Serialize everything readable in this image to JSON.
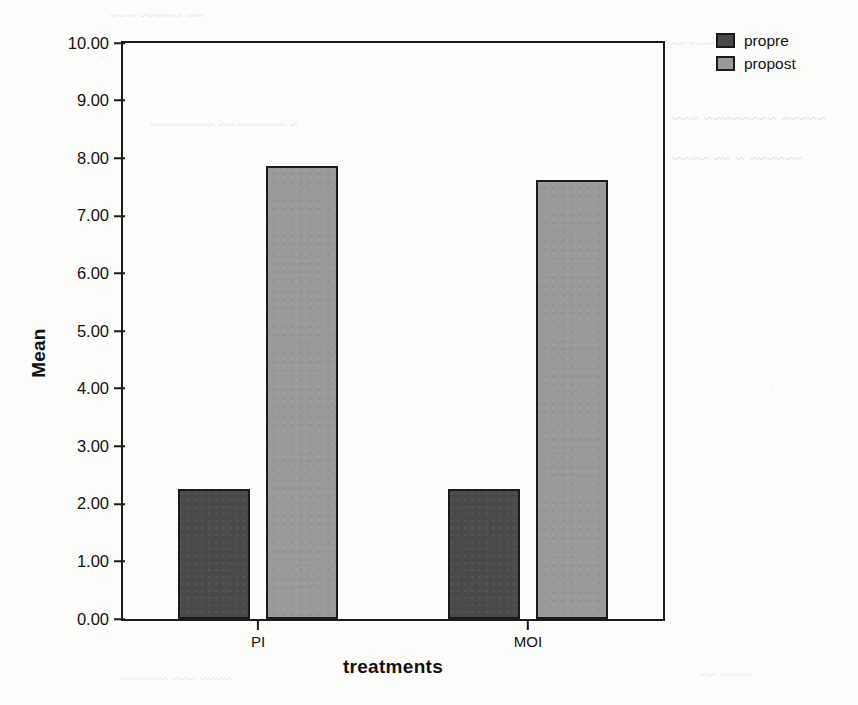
{
  "chart_data": {
    "type": "bar",
    "title": "",
    "xlabel": "treatments",
    "ylabel": "Mean",
    "categories": [
      "PI",
      "MOI"
    ],
    "series": [
      {
        "name": "propre",
        "values": [
          2.26,
          2.26
        ],
        "color": "#4a4a4a"
      },
      {
        "name": "propost",
        "values": [
          7.87,
          7.62
        ],
        "color": "#9a9a9a"
      }
    ],
    "ylim": [
      0,
      10
    ],
    "ytick_values": [
      0,
      1,
      2,
      3,
      4,
      5,
      6,
      7,
      8,
      9,
      10
    ],
    "ytick_labels": [
      "0.00",
      "1.00",
      "2.00",
      "3.00",
      "4.00",
      "5.00",
      "6.00",
      "7.00",
      "8.00",
      "9.00",
      "10.00"
    ],
    "grid": false,
    "legend_position": "top-right",
    "legend_entries": [
      "propre",
      "propost"
    ]
  },
  "axes": {
    "y_title": "Mean",
    "x_title": "treatments"
  },
  "legend": {
    "items": [
      {
        "label": "propre"
      },
      {
        "label": "propost"
      }
    ]
  },
  "scan_artifacts": {
    "bleed_top": "~~ ~~~~~ ~~~",
    "bleed_right_1": "~~~ ~~",
    "bleed_mid": "~ ~~~~~~ ~~ ~~~~~~~~",
    "bleed_right_2": "~~~~~ ~~~~~~~~ ~~~",
    "bleed_right_3": "~~~~~~ ~ ~~ ~~~~",
    "bleed_bottom": "~~~~ ~~~ ~~~~~~",
    "bleed_right_4": "~~~~ ~~"
  }
}
